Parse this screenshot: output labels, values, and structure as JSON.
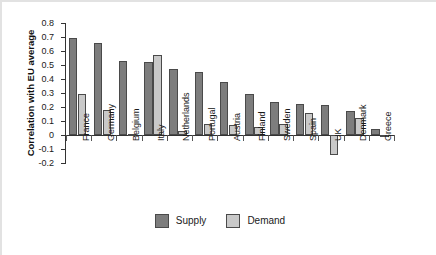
{
  "chart_data": {
    "type": "bar",
    "title": "",
    "xlabel": "",
    "ylabel": "Correlation with EU average",
    "ylim": [
      -0.2,
      0.8
    ],
    "ytick_labels": [
      "0.8",
      "0.7",
      "0.6",
      "0.5",
      "0.4",
      "0.3",
      "0.2",
      "0.1",
      "0",
      "-0.1",
      "-0.2"
    ],
    "ytick_values": [
      0.8,
      0.7,
      0.6,
      0.5,
      0.4,
      0.3,
      0.2,
      0.1,
      0,
      -0.1,
      -0.2
    ],
    "grid": false,
    "legend_position": "bottom-center",
    "categories": [
      "France",
      "Germany",
      "Belgium",
      "Italy",
      "Netherlands",
      "Portugal",
      "Austria",
      "Finland",
      "Sweden",
      "Spain",
      "UK",
      "Denmark",
      "Greece"
    ],
    "series": [
      {
        "name": "Supply",
        "color": "#7d7d7d",
        "values": [
          0.695,
          0.66,
          0.53,
          0.52,
          0.47,
          0.45,
          0.38,
          0.29,
          0.235,
          0.22,
          0.215,
          0.175,
          0.04
        ]
      },
      {
        "name": "Demand",
        "color": "#c9c9c9",
        "values": [
          0.295,
          0.18,
          0.01,
          0.57,
          0.03,
          0.08,
          0.07,
          0.055,
          0.08,
          0.155,
          -0.145,
          0.12,
          -0.01
        ]
      }
    ]
  },
  "legend": {
    "items": [
      {
        "label": "Supply",
        "color": "#7d7d7d"
      },
      {
        "label": "Demand",
        "color": "#c9c9c9"
      }
    ]
  }
}
